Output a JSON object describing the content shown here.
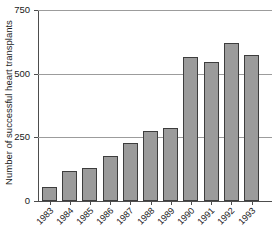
{
  "chart_data": {
    "type": "bar",
    "title": "",
    "subtitle": "",
    "xlabel": "",
    "ylabel": "Number of successful heart transplants",
    "categories": [
      "1983",
      "1984",
      "1985",
      "1986",
      "1987",
      "1988",
      "1989",
      "1990",
      "1991",
      "1992",
      "1993"
    ],
    "values": [
      55,
      118,
      128,
      178,
      228,
      275,
      287,
      565,
      545,
      620,
      572
    ],
    "ylim": [
      0,
      750
    ],
    "yticks": [
      0,
      250,
      500,
      750
    ],
    "ytick_labels": [
      "0",
      "250",
      "500",
      "750"
    ],
    "grid": "horizontal",
    "legend": "none",
    "bar_color": "#9b9b9b",
    "bar_border_color": "#3d3d3d",
    "axis_color": "#4d4d4d",
    "gridline_color": "#9c9c9c",
    "background_color": "#ffffff"
  }
}
